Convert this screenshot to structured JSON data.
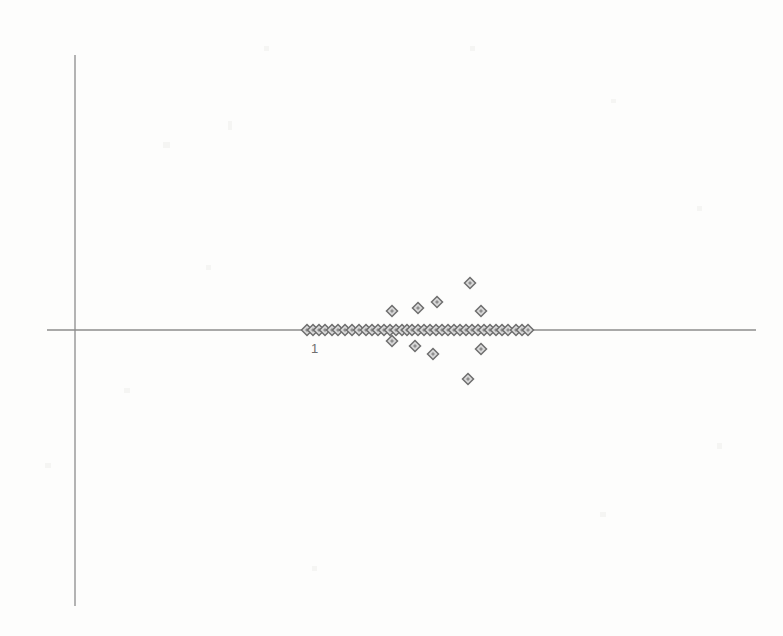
{
  "figure": {
    "kind": "scanned-scatter-plot",
    "background_color": "#fdfdfc",
    "axis_color": "#8c8c8c",
    "marker_outline_color": "#6e6e6e",
    "marker_fill_color": "#d8d8d8",
    "label_color": "#6f6f6f"
  },
  "axes": {
    "origin_px": [
      75,
      330
    ],
    "x_axis": {
      "x_start_px": 47,
      "x_end_px": 756,
      "y_px": 330
    },
    "y_axis": {
      "y_start_px": 55,
      "y_end_px": 606,
      "x_px": 75
    },
    "x_tick_labels": [
      {
        "text": "1",
        "x_px": 311,
        "y_px": 342
      }
    ],
    "y_tick_labels": [],
    "xlabel": "",
    "ylabel": "",
    "title": "",
    "grid": false,
    "legend": null
  },
  "chart_data": {
    "type": "scatter",
    "title": "",
    "xlabel": "",
    "ylabel": "",
    "grid": false,
    "legend_position": null,
    "xlim": [
      0,
      783
    ],
    "ylim": [
      0,
      636
    ],
    "axis_origin": [
      75,
      330
    ],
    "tick_labels": {
      "x": [
        "1"
      ],
      "y": []
    },
    "marker": "diamond",
    "marker_size_px": 11,
    "note": "Points are given in pixel coordinates of the scanned figure. The vast majority lie exactly on the horizontal axis (y=330); a smaller set is scattered above and below it.",
    "points_on_axis": [
      [
        307,
        330
      ],
      [
        313,
        330
      ],
      [
        319,
        330
      ],
      [
        325,
        330
      ],
      [
        332,
        330
      ],
      [
        338,
        330
      ],
      [
        345,
        330
      ],
      [
        352,
        330
      ],
      [
        359,
        330
      ],
      [
        366,
        330
      ],
      [
        372,
        330
      ],
      [
        378,
        330
      ],
      [
        384,
        330
      ],
      [
        390,
        330
      ],
      [
        396,
        330
      ],
      [
        402,
        330
      ],
      [
        407,
        330
      ],
      [
        412,
        330
      ],
      [
        418,
        330
      ],
      [
        424,
        330
      ],
      [
        430,
        330
      ],
      [
        436,
        330
      ],
      [
        442,
        330
      ],
      [
        448,
        330
      ],
      [
        454,
        330
      ],
      [
        460,
        330
      ],
      [
        466,
        330
      ],
      [
        472,
        330
      ],
      [
        478,
        330
      ],
      [
        484,
        330
      ],
      [
        490,
        330
      ],
      [
        496,
        330
      ],
      [
        502,
        330
      ],
      [
        508,
        330
      ],
      [
        516,
        330
      ],
      [
        522,
        330
      ],
      [
        528,
        330
      ]
    ],
    "points_off_axis": [
      [
        470,
        283
      ],
      [
        437,
        302
      ],
      [
        481,
        311
      ],
      [
        418,
        308
      ],
      [
        392,
        311
      ],
      [
        392,
        341
      ],
      [
        415,
        346
      ],
      [
        433,
        354
      ],
      [
        481,
        349
      ],
      [
        468,
        379
      ]
    ],
    "counts": {
      "on_axis": 37,
      "off_axis": 10,
      "total": 47
    }
  }
}
